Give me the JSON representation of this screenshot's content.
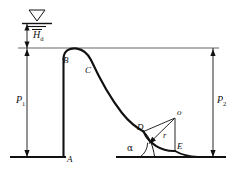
{
  "figure": {
    "type": "engineering-diagram",
    "stroke_color": "#111111",
    "thin_line_color": "#444444",
    "background": "#ffffff"
  },
  "labels": {
    "head": "H",
    "head_sub": "d",
    "upstream_height": "P",
    "upstream_height_sub": "1",
    "downstream_height": "P",
    "downstream_height_sub": "2",
    "point_a": "A",
    "point_b": "B",
    "point_c": "C",
    "point_d": "D",
    "point_e": "E",
    "bucket_center": "o",
    "radius": "r",
    "angle": "α"
  },
  "annotations": {
    "water_surface_symbol": "water-level-triangle",
    "crest_datum_line": "upstream-design-water-level",
    "dimension_hd": "design head above crest",
    "dimension_p1": "upstream weir height",
    "dimension_p2": "downstream weir height",
    "bucket": "circular bucket of radius r centered at o",
    "toe_angle": "angle alpha between spillway face and apron"
  },
  "geometry": {
    "crest_level_y": 48,
    "bed_level_y": 157,
    "water_symbol_x": 37,
    "water_symbol_y": 14,
    "dam_face_x": 63,
    "crest_x": 63,
    "bucket_center": {
      "x": 175,
      "y": 118
    },
    "bucket_radius": 33,
    "point_d": {
      "x": 143,
      "y": 131
    },
    "point_e": {
      "x": 175,
      "y": 151
    },
    "left_dim_x": 27,
    "right_dim_x": 213
  }
}
